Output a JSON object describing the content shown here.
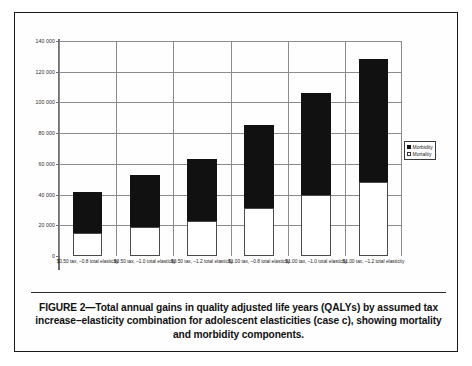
{
  "figure": {
    "caption": "FIGURE 2—Total annual gains in quality adjusted life years (QALYs) by assumed tax increase–elasticity combination for adolescent elasticities (case c), showing mortality and morbidity components."
  },
  "chart_data": {
    "type": "bar",
    "stacked": true,
    "title": "",
    "xlabel": "",
    "ylabel": "",
    "ylim": [
      0,
      140000
    ],
    "yticks": [
      0,
      20000,
      40000,
      60000,
      80000,
      100000,
      120000,
      140000
    ],
    "ytick_labels": [
      "0",
      "20 000",
      "40 000",
      "60 000",
      "80 000",
      "100 000",
      "120 000",
      "140 000"
    ],
    "grid": true,
    "legend_position": "right",
    "categories": [
      "$0.50 tax, –0.8 total elasticity",
      "$0.50 tax, –1.0 total elasticity",
      "$0.50 tax, –1.2 total elasticity",
      "$1.00 tax, –0.8 total elasticity",
      "$1.00 tax, –1.0 total elasticity",
      "$1.00 tax, –1.2 total elasticity"
    ],
    "series": [
      {
        "name": "Mortality",
        "color": "#ffffff",
        "values": [
          15000,
          19000,
          22500,
          31000,
          40000,
          48000
        ]
      },
      {
        "name": "Morbidity",
        "color": "#111111",
        "values": [
          27000,
          34000,
          40500,
          54000,
          66000,
          80000
        ]
      }
    ],
    "totals": [
      42000,
      53000,
      63000,
      85000,
      106000,
      128000
    ]
  },
  "legend": {
    "items": [
      {
        "label": "Morbidity",
        "swatch": "filled-black-square"
      },
      {
        "label": "Mortality",
        "swatch": "open-white-square"
      }
    ]
  }
}
